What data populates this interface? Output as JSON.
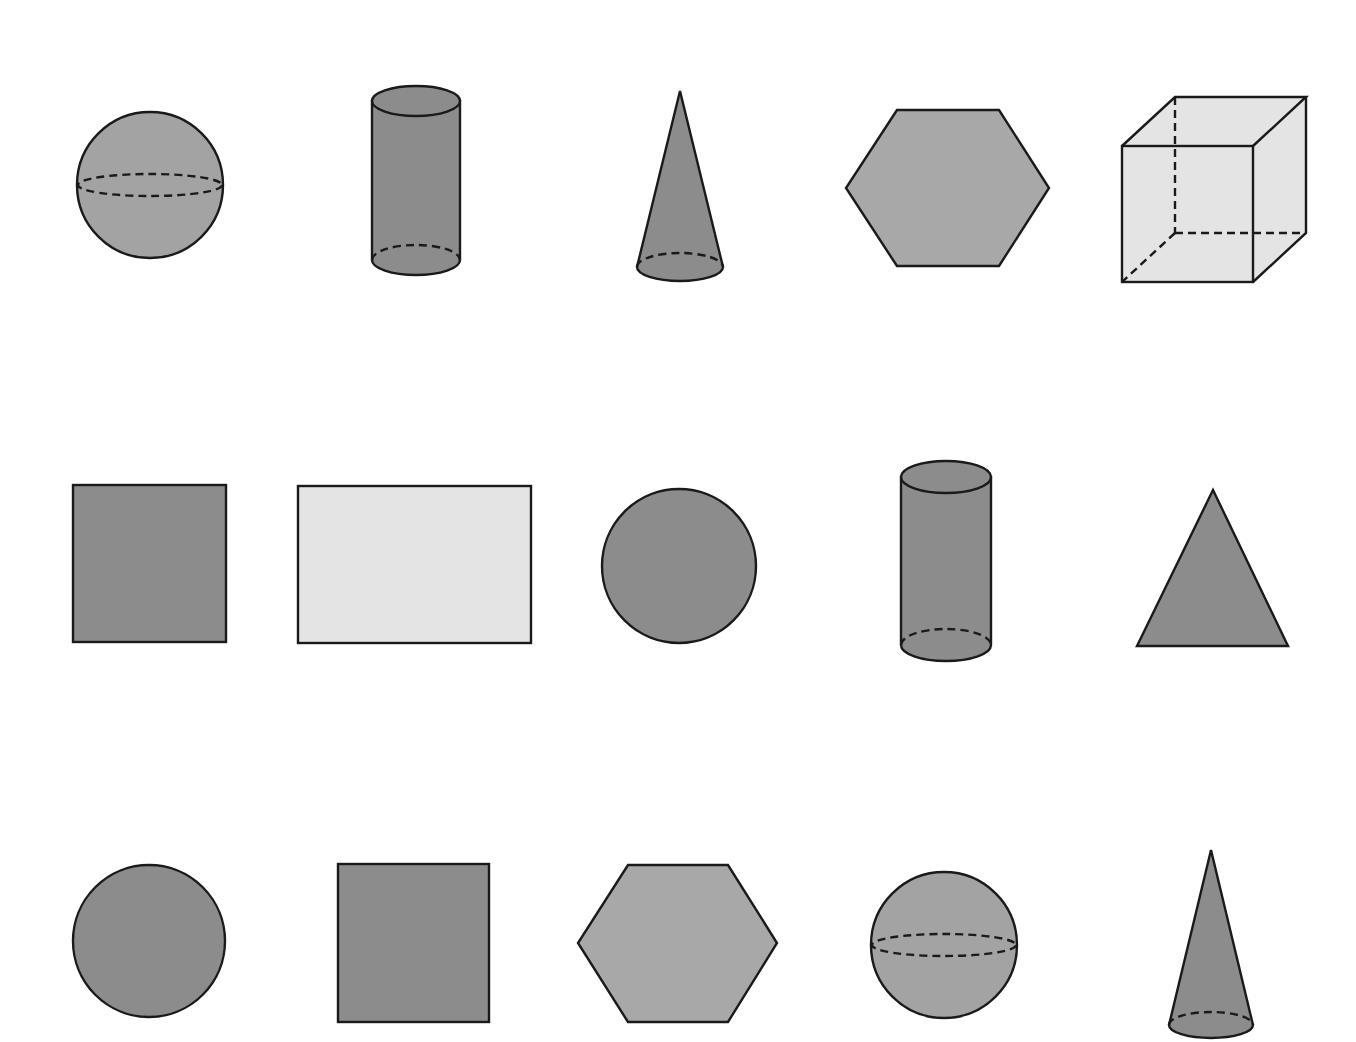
{
  "colors": {
    "sphere": "#a3a3a3",
    "dark": "#8c8c8c",
    "hexagon": "#a8a8a8",
    "light": "#e4e4e4",
    "stroke": "#1a1a1a"
  },
  "rows": [
    {
      "row": 1,
      "shapes": [
        "sphere",
        "cylinder",
        "cone",
        "hexagon",
        "cube"
      ]
    },
    {
      "row": 2,
      "shapes": [
        "square",
        "rectangle",
        "circle",
        "cylinder",
        "triangle"
      ]
    },
    {
      "row": 3,
      "shapes": [
        "circle",
        "square",
        "hexagon",
        "sphere",
        "cone"
      ]
    }
  ]
}
